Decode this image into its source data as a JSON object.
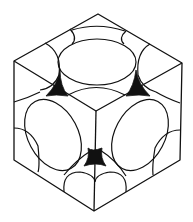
{
  "figure": {
    "colors": {
      "line": "#111111",
      "void": "#111111",
      "background": "#ffffff"
    },
    "vertices": {
      "top": [
        98,
        14
      ],
      "left": [
        14,
        61
      ],
      "right": [
        182,
        63
      ],
      "center": [
        96,
        111
      ],
      "left_bottom": [
        14,
        160
      ],
      "right_bottom": [
        180,
        160
      ],
      "bottom": [
        94,
        211
      ]
    },
    "faces": [
      "top",
      "left",
      "right"
    ],
    "voids": [
      {
        "name": "left-void",
        "cx": 57,
        "cy": 86
      },
      {
        "name": "right-void",
        "cx": 136,
        "cy": 86
      },
      {
        "name": "bottom-void",
        "cx": 95,
        "cy": 158
      }
    ]
  }
}
